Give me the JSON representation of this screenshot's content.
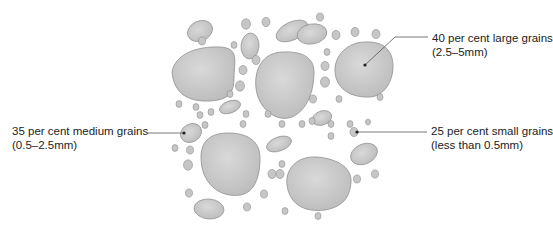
{
  "diagram": {
    "colors": {
      "grain_fill": "#c6c6c6",
      "grain_highlight": "#d8d8d8",
      "grain_stroke": "#8f8f8f",
      "leader_line": "#555555",
      "text": "#222222",
      "background": "#ffffff"
    },
    "labels": [
      {
        "id": "large",
        "line1": "40 per cent large grains",
        "line2": "(2.5–5mm)",
        "percent": 40,
        "size_range": "2.5–5mm",
        "leader": {
          "x1": 428,
          "y1": 37,
          "x2": 395,
          "y2": 37,
          "x3": 365,
          "y3": 65
        }
      },
      {
        "id": "medium",
        "line1": "35 per cent medium grains",
        "line2": "(0.5–2.5mm)",
        "percent": 35,
        "size_range": "0.5–2.5mm",
        "leader": {
          "x1": 148,
          "y1": 133,
          "x2": 184,
          "y2": 133
        }
      },
      {
        "id": "small",
        "line1": "25 per cent small grains",
        "line2": "(less than 0.5mm)",
        "percent": 25,
        "size_range": "less than 0.5mm",
        "leader": {
          "x1": 427,
          "y1": 132,
          "x2": 357,
          "y2": 132
        }
      }
    ],
    "large_grains": [
      {
        "d": "M172,72 C175,55 195,46 220,47 C240,48 234,62 234,78 C234,96 225,100 210,101 C190,102 174,95 172,72 Z"
      },
      {
        "d": "M256,88 C254,70 262,53 282,52 C300,51 314,56 314,72 C314,90 308,110 292,117 C276,123 258,108 256,88 Z"
      },
      {
        "d": "M335,70 C335,55 348,42 365,42 C385,41 393,52 393,66 C393,82 384,96 370,97 C350,98 335,88 335,70 Z"
      },
      {
        "d": "M201,157 C201,140 212,133 228,133 C246,133 260,140 260,158 C260,178 254,193 240,195 C220,198 201,184 201,157 Z"
      },
      {
        "d": "M287,185 C285,168 298,156 316,157 C334,158 352,166 351,182 C350,198 342,207 325,210 C302,213 289,202 287,185 Z"
      }
    ],
    "medium_grains": [
      {
        "cx": 200,
        "cy": 31,
        "rx": 13,
        "ry": 10,
        "rot": -25
      },
      {
        "cx": 250,
        "cy": 46,
        "rx": 9,
        "ry": 13,
        "rot": 5
      },
      {
        "cx": 292,
        "cy": 31,
        "rx": 17,
        "ry": 9,
        "rot": -25
      },
      {
        "cx": 312,
        "cy": 34,
        "rx": 15,
        "ry": 10,
        "rot": -10
      },
      {
        "cx": 230,
        "cy": 107,
        "rx": 11,
        "ry": 6,
        "rot": -20
      },
      {
        "cx": 322,
        "cy": 118,
        "rx": 10,
        "ry": 7,
        "rot": -20
      },
      {
        "cx": 323,
        "cy": 10,
        "rx": 0,
        "ry": 0,
        "rot": 0
      },
      {
        "cx": 191,
        "cy": 133,
        "rx": 11,
        "ry": 9,
        "rot": -30
      },
      {
        "cx": 279,
        "cy": 144,
        "rx": 13,
        "ry": 7,
        "rot": -20
      },
      {
        "cx": 364,
        "cy": 154,
        "rx": 14,
        "ry": 10,
        "rot": -25
      },
      {
        "cx": 209,
        "cy": 209,
        "rx": 15,
        "ry": 10,
        "rot": 5
      }
    ],
    "small_grains": [
      {
        "cx": 246,
        "cy": 24,
        "r": 4.5
      },
      {
        "cx": 266,
        "cy": 22,
        "r": 4
      },
      {
        "cx": 320,
        "cy": 17,
        "r": 3.5
      },
      {
        "cx": 336,
        "cy": 35,
        "r": 4
      },
      {
        "cx": 355,
        "cy": 32,
        "r": 4
      },
      {
        "cx": 376,
        "cy": 34,
        "r": 4
      },
      {
        "cx": 202,
        "cy": 41,
        "r": 3.5
      },
      {
        "cx": 234,
        "cy": 45,
        "r": 3
      },
      {
        "cx": 256,
        "cy": 60,
        "r": 4
      },
      {
        "cx": 243,
        "cy": 70,
        "r": 4
      },
      {
        "cx": 240,
        "cy": 86,
        "r": 4.5
      },
      {
        "cx": 327,
        "cy": 52,
        "r": 3
      },
      {
        "cx": 325,
        "cy": 66,
        "r": 4
      },
      {
        "cx": 325,
        "cy": 82,
        "r": 4.5
      },
      {
        "cx": 313,
        "cy": 99,
        "r": 3.5
      },
      {
        "cx": 339,
        "cy": 99,
        "r": 3
      },
      {
        "cx": 380,
        "cy": 97,
        "r": 3
      },
      {
        "cx": 230,
        "cy": 94,
        "r": 3
      },
      {
        "cx": 179,
        "cy": 104,
        "r": 3
      },
      {
        "cx": 196,
        "cy": 107,
        "r": 3
      },
      {
        "cx": 211,
        "cy": 112,
        "r": 3
      },
      {
        "cx": 200,
        "cy": 115,
        "r": 3
      },
      {
        "cx": 246,
        "cy": 114,
        "r": 3
      },
      {
        "cx": 268,
        "cy": 114,
        "r": 3
      },
      {
        "cx": 205,
        "cy": 125,
        "r": 3
      },
      {
        "cx": 243,
        "cy": 124,
        "r": 3
      },
      {
        "cx": 282,
        "cy": 124,
        "r": 3
      },
      {
        "cx": 302,
        "cy": 124,
        "r": 3
      },
      {
        "cx": 312,
        "cy": 121,
        "r": 3
      },
      {
        "cx": 331,
        "cy": 124,
        "r": 3
      },
      {
        "cx": 350,
        "cy": 124,
        "r": 3
      },
      {
        "cx": 331,
        "cy": 136,
        "r": 3
      },
      {
        "cx": 354,
        "cy": 132,
        "r": 4
      },
      {
        "cx": 368,
        "cy": 122,
        "r": 2.5
      },
      {
        "cx": 175,
        "cy": 148,
        "r": 3
      },
      {
        "cx": 190,
        "cy": 150,
        "r": 3.5
      },
      {
        "cx": 188,
        "cy": 165,
        "r": 4.5
      },
      {
        "cx": 282,
        "cy": 164,
        "r": 3
      },
      {
        "cx": 272,
        "cy": 174,
        "r": 4
      },
      {
        "cx": 280,
        "cy": 174,
        "r": 4
      },
      {
        "cx": 357,
        "cy": 179,
        "r": 3.5
      },
      {
        "cx": 375,
        "cy": 174,
        "r": 3.5
      },
      {
        "cx": 189,
        "cy": 193,
        "r": 3.5
      },
      {
        "cx": 264,
        "cy": 194,
        "r": 3.5
      },
      {
        "cx": 247,
        "cy": 207,
        "r": 3.5
      },
      {
        "cx": 285,
        "cy": 211,
        "r": 3
      },
      {
        "cx": 318,
        "cy": 216,
        "r": 3
      }
    ]
  }
}
